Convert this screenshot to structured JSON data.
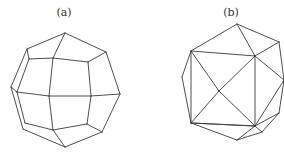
{
  "figures": [
    {
      "label": "(a)",
      "label_pos": [
        64,
        6
      ],
      "description": "polyhedron with square and pentagonal faces (snub-cube-like view)",
      "vertices": {
        "T": [
          65,
          33
        ],
        "UL": [
          27,
          49
        ],
        "UR": [
          106,
          52
        ],
        "IUL": [
          29,
          59
        ],
        "IUC": [
          53,
          58
        ],
        "IUR": [
          88,
          62
        ],
        "FL": [
          11,
          87
        ],
        "LM": [
          17,
          92
        ],
        "C": [
          49,
          96
        ],
        "RM": [
          91,
          96
        ],
        "FR": [
          120,
          94
        ],
        "LL": [
          25,
          123
        ],
        "LL2": [
          23,
          129
        ],
        "ILC": [
          53,
          130
        ],
        "ILR": [
          87,
          124
        ],
        "LR": [
          102,
          132
        ],
        "B": [
          65,
          147
        ]
      },
      "edges": [
        [
          "T",
          "UL"
        ],
        [
          "T",
          "UR"
        ],
        [
          "T",
          "IUC"
        ],
        [
          "UL",
          "IUL"
        ],
        [
          "UL",
          "FL"
        ],
        [
          "IUL",
          "IUC"
        ],
        [
          "IUC",
          "IUR"
        ],
        [
          "IUR",
          "UR"
        ],
        [
          "UR",
          "FR"
        ],
        [
          "IUL",
          "LM"
        ],
        [
          "IUC",
          "C"
        ],
        [
          "IUR",
          "RM"
        ],
        [
          "FL",
          "LM"
        ],
        [
          "LM",
          "C"
        ],
        [
          "C",
          "RM"
        ],
        [
          "RM",
          "FR"
        ],
        [
          "FL",
          "LL2"
        ],
        [
          "LM",
          "LL"
        ],
        [
          "LL",
          "ILC"
        ],
        [
          "LL2",
          "B"
        ],
        [
          "C",
          "ILC"
        ],
        [
          "RM",
          "ILR"
        ],
        [
          "ILC",
          "ILR"
        ],
        [
          "ILR",
          "LR"
        ],
        [
          "FR",
          "LR"
        ],
        [
          "ILC",
          "B"
        ],
        [
          "LR",
          "B"
        ]
      ]
    },
    {
      "label": "(b)",
      "label_pos": [
        231,
        6
      ],
      "description": "triangulated polyhedron (icosahedron-like view) with central square crossed by diagonals",
      "vertices": {
        "T": [
          237,
          24
        ],
        "UR": [
          279,
          42
        ],
        "SUL": [
          191,
          51
        ],
        "SUR": [
          255,
          56
        ],
        "FL": [
          182,
          77
        ],
        "C": [
          219,
          91
        ],
        "R": [
          284,
          80
        ],
        "SLL": [
          191,
          123
        ],
        "SLR": [
          255,
          126
        ],
        "RL": [
          279,
          113
        ],
        "BR": [
          262,
          132
        ],
        "B": [
          237,
          140
        ]
      },
      "edges": [
        [
          "T",
          "SUL"
        ],
        [
          "T",
          "SUR"
        ],
        [
          "T",
          "UR"
        ],
        [
          "UR",
          "SUR"
        ],
        [
          "UR",
          "R"
        ],
        [
          "SUL",
          "SUR"
        ],
        [
          "SUR",
          "SLR"
        ],
        [
          "SLR",
          "SLL"
        ],
        [
          "SLL",
          "SUL"
        ],
        [
          "SUL",
          "C"
        ],
        [
          "C",
          "SLR"
        ],
        [
          "SUR",
          "C"
        ],
        [
          "C",
          "SLL"
        ],
        [
          "SUL",
          "FL"
        ],
        [
          "FL",
          "SLL"
        ],
        [
          "SUR",
          "R"
        ],
        [
          "R",
          "RL"
        ],
        [
          "R",
          "SLR"
        ],
        [
          "RL",
          "SLR"
        ],
        [
          "RL",
          "BR"
        ],
        [
          "SLL",
          "B"
        ],
        [
          "SLL",
          "SLR"
        ],
        [
          "SLR",
          "B"
        ],
        [
          "BR",
          "B"
        ],
        [
          "SLR",
          "BR"
        ]
      ]
    }
  ]
}
